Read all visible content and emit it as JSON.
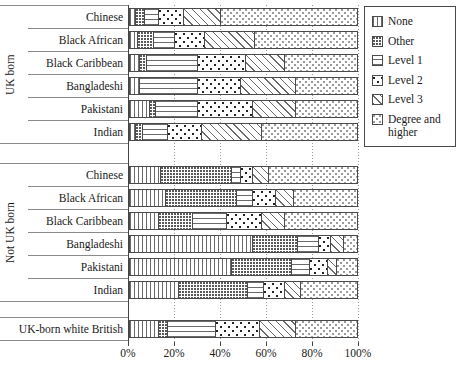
{
  "chart_data": {
    "type": "bar",
    "orientation": "horizontal-stacked",
    "unit": "percent",
    "xlim": [
      0,
      100
    ],
    "x_ticks": [
      "0%",
      "20%",
      "40%",
      "60%",
      "80%",
      "100%"
    ],
    "grid": "dotted-vertical",
    "legend_position": "top-right",
    "series": [
      {
        "name": "None",
        "pattern": "vertical-lines"
      },
      {
        "name": "Other",
        "pattern": "fine-dots"
      },
      {
        "name": "Level 1",
        "pattern": "horizontal-lines"
      },
      {
        "name": "Level 2",
        "pattern": "polka-dots"
      },
      {
        "name": "Level 3",
        "pattern": "diagonal-lines"
      },
      {
        "name": "Degree and higher",
        "pattern": "light-dot-lattice"
      }
    ],
    "groups": [
      {
        "label": "UK born",
        "rows": [
          {
            "label": "Chinese",
            "values": [
              3,
              4,
              6,
              11,
              16,
              60
            ]
          },
          {
            "label": "Black African",
            "values": [
              4,
              7,
              9,
              13,
              22,
              45
            ]
          },
          {
            "label": "Black Caribbean",
            "values": [
              5,
              3,
              22,
              21,
              17,
              32
            ]
          },
          {
            "label": "Bangladeshi",
            "values": [
              5,
              0,
              25,
              19,
              24,
              27
            ]
          },
          {
            "label": "Pakistani",
            "values": [
              9,
              3,
              18,
              24,
              19,
              27
            ]
          },
          {
            "label": "Indian",
            "values": [
              3,
              3,
              11,
              15,
              26,
              42
            ]
          }
        ]
      },
      {
        "label": "Not UK born",
        "rows": [
          {
            "label": "Chinese",
            "values": [
              14,
              31,
              4,
              5,
              7,
              39
            ]
          },
          {
            "label": "Black African",
            "values": [
              16,
              31,
              7,
              10,
              8,
              28
            ]
          },
          {
            "label": "Black Caribbean",
            "values": [
              13,
              15,
              15,
              15,
              10,
              32
            ]
          },
          {
            "label": "Bangladeshi",
            "values": [
              54,
              20,
              9,
              5,
              6,
              6
            ]
          },
          {
            "label": "Pakistani",
            "values": [
              45,
              26,
              8,
              8,
              4,
              9
            ]
          },
          {
            "label": "Indian",
            "values": [
              22,
              30,
              7,
              9,
              7,
              25
            ]
          }
        ]
      },
      {
        "label": "",
        "rows": [
          {
            "label": "UK-born white British",
            "values": [
              13,
              4,
              21,
              19,
              16,
              27
            ]
          }
        ]
      }
    ]
  },
  "colors": {
    "ink": "#1a1a1a",
    "bar_outline": "#4a4a4a",
    "gridline": "#999999",
    "separator": "#8a8a8a",
    "background": "#ffffff"
  }
}
